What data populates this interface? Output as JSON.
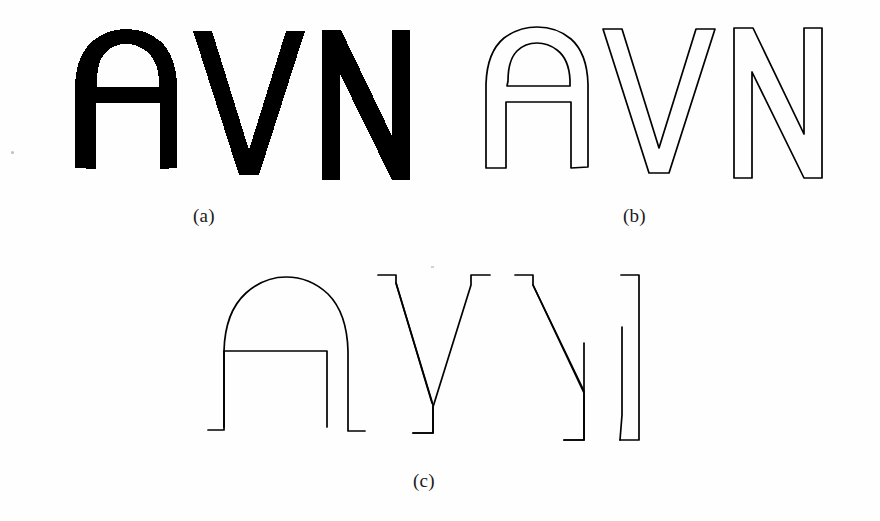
{
  "figure": {
    "kind": "multi-panel-figure",
    "background_color": "#fefefe",
    "ink_color": "#000000",
    "width": 880,
    "height": 521,
    "depicted_text": "AVN"
  },
  "panels": [
    {
      "id": "a",
      "caption": "(a)",
      "description": "filled binary letters",
      "letters": [
        "A",
        "V",
        "N"
      ],
      "render": "solid-fill",
      "fill_color": "#000000",
      "stroke_color": "none"
    },
    {
      "id": "b",
      "caption": "(b)",
      "description": "closed contour outlines",
      "letters": [
        "A",
        "V",
        "N"
      ],
      "render": "closed-outline",
      "fill_color": "none",
      "stroke_color": "#000000",
      "stroke_width": 1.6
    },
    {
      "id": "c",
      "caption": "(c)",
      "description": "partial open edge contours",
      "letters": [
        "A",
        "V",
        "N"
      ],
      "render": "open-contour",
      "fill_color": "none",
      "stroke_color": "#000000",
      "stroke_width": 1.6
    }
  ],
  "captions": {
    "a": "(a)",
    "b": "(b)",
    "c": "(c)"
  }
}
